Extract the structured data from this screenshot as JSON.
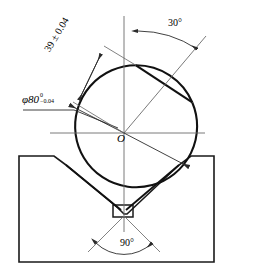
{
  "drawing": {
    "title": "Shaft with flats located in 90-degree V-block",
    "center_label": "O",
    "dimensions": {
      "diameter": {
        "name": "shaft-diameter",
        "symbol": "φ80",
        "upper_tolerance": "0",
        "lower_tolerance": "−0.04"
      },
      "flat_distance": {
        "name": "flat-distance",
        "text": "39 ± 0.04"
      },
      "flat_angle": {
        "name": "flat-angle",
        "text": "30°"
      },
      "vee_angle": {
        "name": "vee-block-angle",
        "text": "90°"
      }
    },
    "colors": {
      "outline": "#1a1a1a",
      "thin_line": "#4a4a4a",
      "background": "#ffffff"
    }
  }
}
